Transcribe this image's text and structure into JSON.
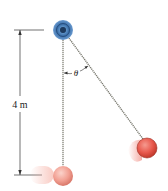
{
  "diagram": {
    "type": "pendulum",
    "labels": {
      "length": "4 m",
      "angle": "θ"
    },
    "colors": {
      "pivot_outer": "#4d7fb3",
      "pivot_inner": "#2f5f95",
      "rope": "#8a8a80",
      "ball": "#e8645a",
      "ball_rest": "#f2a79a",
      "dimension_line": "#333333"
    },
    "geometry": {
      "pivot": [
        63,
        30
      ],
      "ball_rest": [
        63,
        175
      ],
      "ball_swung": [
        148,
        148
      ]
    }
  }
}
